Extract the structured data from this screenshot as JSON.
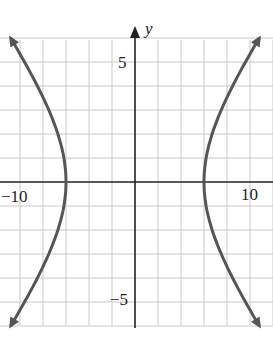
{
  "part_label": "b.",
  "chart_data": {
    "type": "line",
    "title": "",
    "xlabel": "",
    "ylabel": "y",
    "x_tick_labels": [
      "-10",
      "10"
    ],
    "y_tick_labels": [
      "5",
      "-5"
    ],
    "xlim": [
      -11.7,
      11.7
    ],
    "ylim": [
      -6.5,
      6.5
    ],
    "grid": true,
    "grid_step_x": 2,
    "grid_step_y": 1,
    "series": [
      {
        "name": "right branch",
        "vertex": [
          6,
          0
        ],
        "points": [
          [
            10.8,
            -6
          ],
          [
            9.6,
            -5
          ],
          [
            8.5,
            -4
          ],
          [
            7.5,
            -3
          ],
          [
            6.7,
            -2
          ],
          [
            6.2,
            -1
          ],
          [
            6,
            0
          ],
          [
            6.2,
            1
          ],
          [
            6.7,
            2
          ],
          [
            7.5,
            3
          ],
          [
            8.5,
            4
          ],
          [
            9.6,
            5
          ],
          [
            10.8,
            6
          ]
        ]
      },
      {
        "name": "left branch",
        "vertex": [
          -6,
          0
        ],
        "points": [
          [
            -10.8,
            -6
          ],
          [
            -9.6,
            -5
          ],
          [
            -8.5,
            -4
          ],
          [
            -7.5,
            -3
          ],
          [
            -6.7,
            -2
          ],
          [
            -6.2,
            -1
          ],
          [
            -6,
            0
          ],
          [
            -6.2,
            1
          ],
          [
            -6.7,
            2
          ],
          [
            -7.5,
            3
          ],
          [
            -8.5,
            4
          ],
          [
            -9.6,
            5
          ],
          [
            -10.8,
            6
          ]
        ]
      }
    ],
    "equation": "x^2/36 - y^2/16 = 1"
  },
  "labels": {
    "y_axis": "y",
    "x_neg": "-10",
    "x_pos": "10",
    "y_pos": "5",
    "y_neg": "-5"
  }
}
